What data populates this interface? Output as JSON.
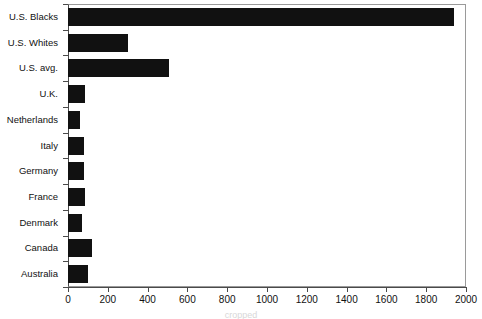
{
  "chart_data": {
    "type": "bar",
    "orientation": "horizontal",
    "title": "",
    "xlabel": "",
    "ylabel": "",
    "xlim": [
      0,
      2000
    ],
    "xticks": [
      0,
      200,
      400,
      600,
      800,
      1000,
      1200,
      1400,
      1600,
      1800,
      2000
    ],
    "grid": false,
    "legend": null,
    "bar_color": "#111111",
    "background_color": "#ffffff",
    "categories": [
      "U.S. Blacks",
      "U.S. Whites",
      "U.S. avg.",
      "U.K.",
      "Netherlands",
      "Italy",
      "Germany",
      "France",
      "Denmark",
      "Canada",
      "Australia"
    ],
    "values": [
      1940,
      300,
      510,
      85,
      60,
      80,
      80,
      85,
      70,
      120,
      100
    ]
  },
  "caption": {
    "text": "cropped"
  }
}
